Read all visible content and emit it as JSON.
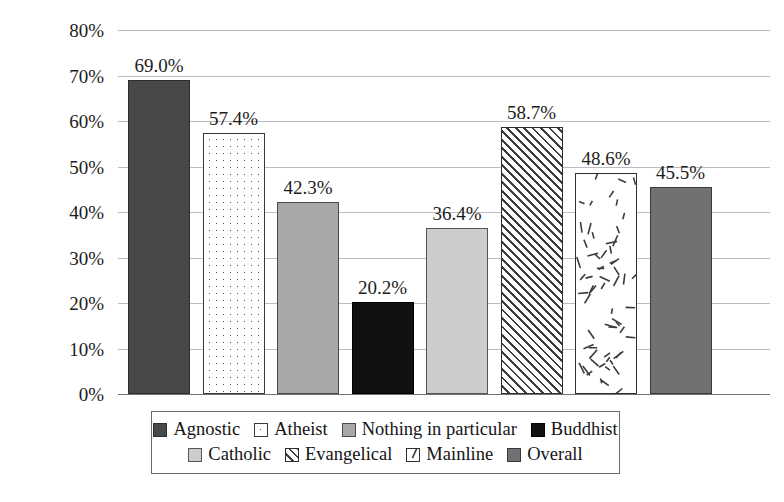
{
  "chart_data": {
    "type": "bar",
    "title": "",
    "xlabel": "",
    "ylabel": "",
    "ylim": [
      0,
      80
    ],
    "grid": true,
    "legend_position": "bottom",
    "tick_labels": [
      "80%",
      "70%",
      "60%",
      "50%",
      "40%",
      "30%",
      "20%",
      "10%",
      "0%"
    ],
    "tick_values": [
      80,
      70,
      60,
      50,
      40,
      30,
      20,
      10,
      0
    ],
    "categories": [
      "Agnostic",
      "Atheist",
      "Nothing in particular",
      "Buddhist",
      "Catholic",
      "Evangelical",
      "Mainline",
      "Overall"
    ],
    "values": [
      69.0,
      57.4,
      42.3,
      20.2,
      36.4,
      58.7,
      48.6,
      45.5
    ],
    "data_labels": [
      "69.0%",
      "57.4%",
      "42.3%",
      "20.2%",
      "36.4%",
      "58.7%",
      "48.6%",
      "45.5%"
    ],
    "series": [
      {
        "name": "Share",
        "points": [
          {
            "category": "Agnostic",
            "value": 69.0,
            "label": "69.0%",
            "fill": "solid-dark-gray",
            "fill_color": "#484848"
          },
          {
            "category": "Atheist",
            "value": 57.4,
            "label": "57.4%",
            "fill": "white-dotted",
            "fill_color": "#ffffff"
          },
          {
            "category": "Nothing in particular",
            "value": 42.3,
            "label": "42.3%",
            "fill": "solid-mid-gray",
            "fill_color": "#a8a8a8"
          },
          {
            "category": "Buddhist",
            "value": 20.2,
            "label": "20.2%",
            "fill": "solid-black",
            "fill_color": "#111111"
          },
          {
            "category": "Catholic",
            "value": 36.4,
            "label": "36.4%",
            "fill": "solid-light-gray",
            "fill_color": "#cccccc"
          },
          {
            "category": "Evangelical",
            "value": 58.7,
            "label": "58.7%",
            "fill": "diagonal-hatch",
            "fill_color": "#ffffff"
          },
          {
            "category": "Mainline",
            "value": 48.6,
            "label": "48.6%",
            "fill": "confetti-dashes",
            "fill_color": "#ffffff"
          },
          {
            "category": "Overall",
            "value": 45.5,
            "label": "45.5%",
            "fill": "solid-gray",
            "fill_color": "#717171"
          }
        ]
      }
    ]
  },
  "legend": {
    "row1": [
      {
        "label": "Agnostic",
        "fill": "solid-dark-gray"
      },
      {
        "label": "Atheist",
        "fill": "white-dotted"
      },
      {
        "label": "Nothing in particular",
        "fill": "solid-mid-gray"
      },
      {
        "label": "Buddhist",
        "fill": "solid-black"
      }
    ],
    "row2": [
      {
        "label": "Catholic",
        "fill": "solid-light-gray"
      },
      {
        "label": "Evangelical",
        "fill": "diagonal-hatch"
      },
      {
        "label": "Mainline",
        "fill": "confetti-dashes"
      },
      {
        "label": "Overall",
        "fill": "solid-gray"
      }
    ]
  },
  "colors": {
    "agnostic": "#484848",
    "atheist": "#ffffff",
    "nothing_in_particular": "#a8a8a8",
    "buddhist": "#111111",
    "catholic": "#cccccc",
    "evangelical": "#ffffff",
    "mainline": "#ffffff",
    "overall": "#717171",
    "gridline": "#b9bcc2",
    "axis": "#6f7378",
    "text": "#1c1c1c"
  }
}
